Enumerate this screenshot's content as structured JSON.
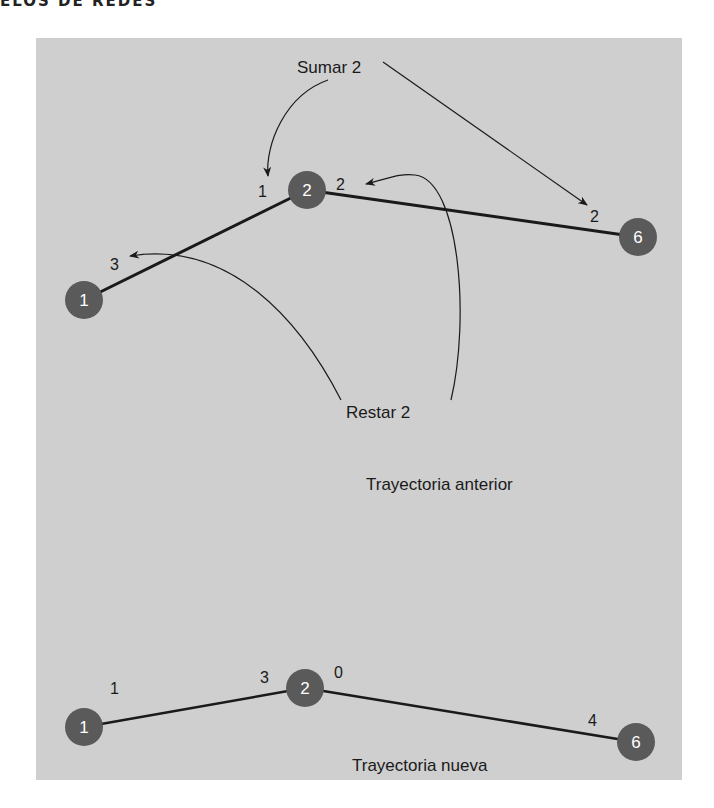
{
  "header": {
    "text": "ELOS DE REDES"
  },
  "colors": {
    "panel": "#cfcfcf",
    "node": "#5a5a5a",
    "line": "#1a1a1a"
  },
  "diagram_top": {
    "caption": "Trayectoria anterior",
    "annotation_add": "Sumar 2",
    "annotation_subtract": "Restar 2",
    "nodes": [
      {
        "id": "1",
        "label": "1"
      },
      {
        "id": "2",
        "label": "2"
      },
      {
        "id": "6",
        "label": "6"
      }
    ],
    "edges": [
      {
        "from": "1",
        "to": "2",
        "label_near_from": "3",
        "label_near_to": "1"
      },
      {
        "from": "2",
        "to": "6",
        "label_near_from": "2",
        "label_near_to": "2"
      }
    ]
  },
  "diagram_bottom": {
    "caption": "Trayectoria nueva",
    "nodes": [
      {
        "id": "1",
        "label": "1"
      },
      {
        "id": "2",
        "label": "2"
      },
      {
        "id": "6",
        "label": "6"
      }
    ],
    "edges": [
      {
        "from": "1",
        "to": "2",
        "label_near_from": "1",
        "label_near_to": "3"
      },
      {
        "from": "2",
        "to": "6",
        "label_near_from": "0",
        "label_near_to": "4"
      }
    ]
  }
}
